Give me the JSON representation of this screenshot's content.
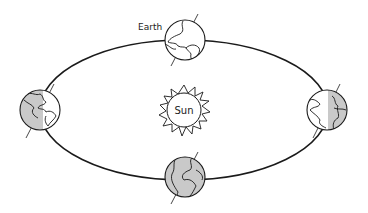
{
  "diagram": {
    "type": "earth-orbit",
    "labels": {
      "earth": "Earth",
      "sun": "Sun"
    },
    "earth_positions": [
      {
        "name": "top",
        "shading": "none"
      },
      {
        "name": "left",
        "shading": "left-half"
      },
      {
        "name": "right",
        "shading": "right-half"
      },
      {
        "name": "bottom",
        "shading": "full"
      }
    ],
    "colors": {
      "stroke": "#1a1a1a",
      "shade": "#c9c9c9",
      "background": "#ffffff"
    }
  }
}
